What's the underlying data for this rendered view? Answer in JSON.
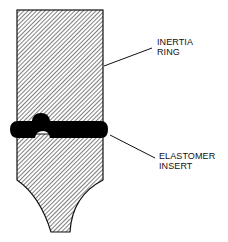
{
  "diagram": {
    "colors": {
      "outline": "#111111",
      "hatch": "#333333",
      "background": "#ffffff",
      "elastomer": "#000000"
    },
    "labels": [
      {
        "id": "inertia-ring",
        "line1": "INERTIA",
        "line2": "RING"
      },
      {
        "id": "elastomer-insert",
        "line1": "ELASTOMER",
        "line2": "INSERT"
      }
    ]
  }
}
